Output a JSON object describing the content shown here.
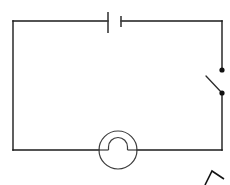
{
  "diagram": {
    "type": "electrical-schematic",
    "background_color": "#ffffff",
    "wire_color": "#1a1a1a",
    "symbol_color": "#3d3d3d",
    "loop": {
      "left_x": 13,
      "right_x": 222,
      "top_y": 21,
      "bottom_y": 150
    },
    "components": [
      {
        "name": "battery",
        "label": "",
        "position": "top-edge",
        "long_plate_x": 108,
        "long_plate_y1": 12,
        "long_plate_y2": 33,
        "short_plate_x": 121,
        "short_plate_y1": 16,
        "short_plate_y2": 27,
        "gap_left": 108,
        "gap_right": 121
      },
      {
        "name": "switch",
        "label": "",
        "state": "open",
        "position": "right-edge",
        "upper_terminal_x": 222,
        "upper_terminal_y": 70,
        "lower_terminal_x": 222,
        "lower_terminal_y": 93,
        "blade_tip_x": 206,
        "blade_tip_y": 76,
        "dot_radius": 2.6
      },
      {
        "name": "bell",
        "label": "",
        "position": "bottom-edge",
        "center_x": 118,
        "center_y": 150,
        "radius": 19,
        "arch_radius": 9.5,
        "arch_left_x": 108,
        "arch_right_x": 127
      }
    ],
    "stray_mark": {
      "name": "caret-mark",
      "apex_x": 212,
      "apex_y": 171,
      "left_x": 205,
      "left_y": 185,
      "right_x": 224,
      "right_y": 179
    }
  }
}
